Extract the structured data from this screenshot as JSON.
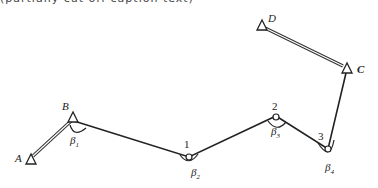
{
  "header_text": "(partially cut off caption text)",
  "diagram": {
    "known_points": [
      {
        "id": "A",
        "label": "A"
      },
      {
        "id": "B",
        "label": "B"
      },
      {
        "id": "C",
        "label": "C"
      },
      {
        "id": "D",
        "label": "D"
      }
    ],
    "traverse_points": [
      {
        "id": "1",
        "label": "1"
      },
      {
        "id": "2",
        "label": "2"
      },
      {
        "id": "3",
        "label": "3"
      }
    ],
    "angles": [
      {
        "id": "beta1",
        "symbol": "β",
        "sub": "1",
        "at": "B"
      },
      {
        "id": "beta2",
        "symbol": "β",
        "sub": "2",
        "at": "1"
      },
      {
        "id": "beta3",
        "symbol": "β",
        "sub": "3",
        "at": "2"
      },
      {
        "id": "beta4",
        "symbol": "β",
        "sub": "4",
        "at": "3"
      }
    ],
    "known_sides": [
      "A-B",
      "D-C"
    ],
    "traverse_legs": [
      "B-1",
      "1-2",
      "2-3",
      "3-C"
    ]
  }
}
